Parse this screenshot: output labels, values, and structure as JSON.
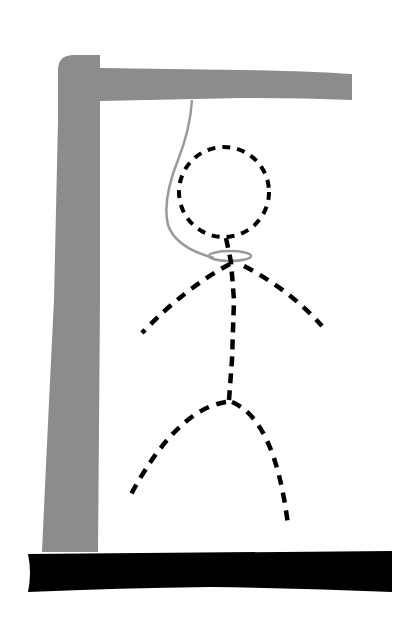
{
  "scene": {
    "title": "Hangman drawing",
    "background": "#ffffff",
    "colors": {
      "gallows": "#8c8c8c",
      "base": "#000000",
      "rope": "#9a9a9a",
      "figure": "#000000"
    },
    "parts": {
      "gallows_post": "gallows-post",
      "gallows_beam": "gallows-beam",
      "base": "ground-base",
      "rope": "rope",
      "noose": "noose",
      "head": "head",
      "body": "torso",
      "left_arm": "left-arm",
      "right_arm": "right-arm",
      "left_leg": "left-leg",
      "right_leg": "right-leg"
    },
    "figure_style": "dashed"
  }
}
